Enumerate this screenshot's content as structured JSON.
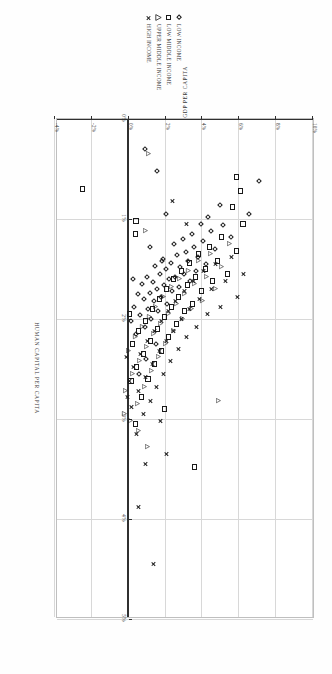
{
  "figure": {
    "orientation_deg": 90,
    "legend": {
      "position": "top-left",
      "items": [
        {
          "label": "LOW INCOME",
          "marker": "diamond-icon",
          "marker_shape": "diamond",
          "color": "#1a1a1a"
        },
        {
          "label": "LOW MIDDLE INCOME",
          "marker": "square-icon",
          "marker_shape": "square",
          "color": "#1a1a1a"
        },
        {
          "label": "UPPER MIDDLE INCOME",
          "marker": "triangle-icon",
          "marker_shape": "triangle",
          "color": "#1a1a1a"
        },
        {
          "label": "HIGH INCOME",
          "marker": "x-icon",
          "marker_shape": "x",
          "color": "#1a1a1a"
        }
      ]
    }
  },
  "chart_data": {
    "type": "scatter",
    "title": "",
    "subtitle": "",
    "xlabel": "HUMAN CAPITAL PER CAPITA",
    "ylabel": "GDP PER CAPITA",
    "xlim": [
      0,
      5
    ],
    "ylim": [
      -4,
      10
    ],
    "xticks": [
      0,
      1,
      2,
      3,
      4,
      5
    ],
    "xticklabels": [
      "0%",
      "1%",
      "2%",
      "3%",
      "4%",
      "5%"
    ],
    "yticks": [
      -4,
      -2,
      0,
      2,
      4,
      6,
      8,
      10
    ],
    "yticklabels": [
      "-4%",
      "-2%",
      "0%",
      "2%",
      "4%",
      "6%",
      "8%",
      "10%"
    ],
    "grid": true,
    "grid_color": "#d8d8d8",
    "axis_color": "#303030",
    "legend_position": "outside-top-left",
    "units": "annual growth rate, percent",
    "series": [
      {
        "name": "LOW INCOME",
        "marker": "diamond",
        "color": "#1a1a1a",
        "points": [
          [
            0.62,
            7.05
          ],
          [
            0.95,
            6.55
          ],
          [
            1.18,
            5.55
          ],
          [
            1.06,
            5.1
          ],
          [
            0.86,
            4.95
          ],
          [
            1.3,
            4.7
          ],
          [
            1.12,
            4.45
          ],
          [
            0.98,
            4.3
          ],
          [
            1.45,
            4.22
          ],
          [
            1.22,
            4.05
          ],
          [
            1.05,
            3.9
          ],
          [
            1.38,
            3.78
          ],
          [
            1.52,
            3.65
          ],
          [
            1.28,
            3.55
          ],
          [
            1.15,
            3.42
          ],
          [
            1.62,
            3.35
          ],
          [
            1.42,
            3.22
          ],
          [
            1.33,
            3.1
          ],
          [
            1.55,
            3.0
          ],
          [
            1.2,
            2.92
          ],
          [
            1.48,
            2.8
          ],
          [
            1.68,
            2.72
          ],
          [
            1.36,
            2.62
          ],
          [
            1.58,
            2.52
          ],
          [
            1.25,
            2.45
          ],
          [
            1.72,
            2.35
          ],
          [
            1.44,
            2.28
          ],
          [
            1.6,
            2.18
          ],
          [
            1.85,
            2.1
          ],
          [
            1.5,
            2.0
          ],
          [
            1.66,
            1.92
          ],
          [
            1.4,
            1.85
          ],
          [
            1.78,
            1.75
          ],
          [
            1.55,
            1.68
          ],
          [
            1.92,
            1.6
          ],
          [
            1.7,
            1.52
          ],
          [
            1.47,
            1.45
          ],
          [
            1.82,
            1.38
          ],
          [
            1.63,
            1.3
          ],
          [
            2.0,
            1.22
          ],
          [
            1.74,
            1.15
          ],
          [
            1.9,
            1.05
          ],
          [
            1.58,
            0.98
          ],
          [
            2.08,
            0.9
          ],
          [
            1.8,
            0.82
          ],
          [
            1.65,
            0.72
          ],
          [
            1.96,
            0.62
          ],
          [
            1.75,
            0.5
          ],
          [
            2.15,
            0.42
          ],
          [
            1.88,
            0.3
          ],
          [
            1.6,
            0.22
          ],
          [
            2.02,
            0.1
          ],
          [
            1.42,
            1.78
          ],
          [
            1.28,
            1.18
          ],
          [
            0.95,
            2.05
          ],
          [
            2.25,
            1.48
          ],
          [
            2.4,
            0.95
          ],
          [
            0.52,
            1.52
          ],
          [
            0.3,
            0.88
          ],
          [
            2.55,
            0.55
          ]
        ]
      },
      {
        "name": "LOW MIDDLE INCOME",
        "marker": "square",
        "color": "#1a1a1a",
        "points": [
          [
            1.05,
            6.2
          ],
          [
            1.32,
            5.85
          ],
          [
            0.88,
            5.62
          ],
          [
            1.55,
            5.35
          ],
          [
            1.18,
            5.05
          ],
          [
            1.42,
            4.8
          ],
          [
            1.62,
            4.55
          ],
          [
            1.28,
            4.38
          ],
          [
            1.5,
            4.15
          ],
          [
            1.72,
            3.95
          ],
          [
            1.35,
            3.8
          ],
          [
            1.58,
            3.62
          ],
          [
            1.85,
            3.48
          ],
          [
            1.44,
            3.32
          ],
          [
            1.66,
            3.18
          ],
          [
            1.92,
            3.02
          ],
          [
            1.52,
            2.88
          ],
          [
            1.78,
            2.72
          ],
          [
            2.05,
            2.58
          ],
          [
            1.6,
            2.45
          ],
          [
            1.88,
            2.3
          ],
          [
            2.18,
            2.18
          ],
          [
            1.7,
            2.05
          ],
          [
            1.98,
            1.92
          ],
          [
            2.32,
            1.8
          ],
          [
            1.8,
            1.68
          ],
          [
            2.1,
            1.55
          ],
          [
            2.45,
            1.42
          ],
          [
            1.9,
            1.3
          ],
          [
            2.22,
            1.18
          ],
          [
            2.6,
            1.05
          ],
          [
            2.02,
            0.92
          ],
          [
            2.35,
            0.8
          ],
          [
            2.78,
            0.68
          ],
          [
            2.12,
            0.55
          ],
          [
            2.48,
            0.42
          ],
          [
            3.05,
            0.35
          ],
          [
            2.25,
            0.22
          ],
          [
            2.62,
            0.12
          ],
          [
            3.48,
            3.55
          ],
          [
            0.72,
            6.05
          ],
          [
            0.58,
            5.85
          ],
          [
            1.95,
            0.05
          ],
          [
            2.9,
            1.95
          ],
          [
            0.7,
            -2.52
          ],
          [
            1.15,
            0.35
          ],
          [
            1.02,
            0.4
          ]
        ]
      },
      {
        "name": "UPPER MIDDLE INCOME",
        "marker": "triangle",
        "color": "#1a1a1a",
        "points": [
          [
            2.82,
            5.35
          ],
          [
            1.25,
            5.95
          ],
          [
            1.48,
            5.52
          ],
          [
            1.7,
            5.18
          ],
          [
            1.35,
            4.92
          ],
          [
            1.58,
            4.68
          ],
          [
            1.82,
            4.45
          ],
          [
            1.42,
            4.25
          ],
          [
            1.65,
            4.05
          ],
          [
            1.9,
            3.88
          ],
          [
            1.52,
            3.7
          ],
          [
            1.75,
            3.52
          ],
          [
            2.0,
            3.38
          ],
          [
            1.6,
            3.22
          ],
          [
            1.85,
            3.05
          ],
          [
            2.12,
            2.92
          ],
          [
            1.68,
            2.78
          ],
          [
            1.95,
            2.62
          ],
          [
            2.25,
            2.48
          ],
          [
            1.78,
            2.35
          ],
          [
            2.05,
            2.2
          ],
          [
            2.38,
            2.08
          ],
          [
            1.88,
            1.95
          ],
          [
            2.15,
            1.82
          ],
          [
            2.52,
            1.7
          ],
          [
            1.98,
            1.58
          ],
          [
            2.28,
            1.45
          ],
          [
            2.68,
            1.32
          ],
          [
            2.08,
            1.2
          ],
          [
            2.42,
            1.08
          ],
          [
            2.85,
            0.95
          ],
          [
            2.18,
            0.82
          ],
          [
            2.55,
            0.7
          ],
          [
            3.02,
            0.58
          ],
          [
            2.32,
            0.45
          ],
          [
            2.72,
            0.32
          ],
          [
            0.35,
            1.55
          ],
          [
            3.28,
            1.48
          ],
          [
            3.12,
            1.02
          ],
          [
            2.95,
            0.22
          ],
          [
            1.12,
            1.38
          ]
        ]
      },
      {
        "name": "HIGH INCOME",
        "marker": "x",
        "color": "#1a1a1a",
        "points": [
          [
            4.45,
            1.32
          ],
          [
            3.88,
            0.52
          ],
          [
            1.55,
            6.25
          ],
          [
            1.78,
            5.88
          ],
          [
            1.38,
            5.55
          ],
          [
            1.62,
            5.25
          ],
          [
            1.88,
            4.98
          ],
          [
            1.45,
            4.72
          ],
          [
            1.7,
            4.48
          ],
          [
            1.95,
            4.25
          ],
          [
            1.52,
            4.05
          ],
          [
            1.8,
            3.85
          ],
          [
            2.08,
            3.68
          ],
          [
            1.62,
            3.5
          ],
          [
            1.9,
            3.32
          ],
          [
            2.18,
            3.15
          ],
          [
            1.72,
            3.0
          ],
          [
            2.0,
            2.85
          ],
          [
            2.3,
            2.7
          ],
          [
            1.82,
            2.55
          ],
          [
            2.12,
            2.42
          ],
          [
            2.42,
            2.28
          ],
          [
            1.92,
            2.15
          ],
          [
            2.22,
            2.02
          ],
          [
            2.55,
            1.9
          ],
          [
            2.02,
            1.78
          ],
          [
            2.32,
            1.65
          ],
          [
            2.68,
            1.52
          ],
          [
            2.12,
            1.4
          ],
          [
            2.45,
            1.28
          ],
          [
            2.82,
            1.15
          ],
          [
            2.22,
            1.02
          ],
          [
            2.58,
            0.9
          ],
          [
            2.95,
            0.78
          ],
          [
            2.35,
            0.65
          ],
          [
            2.72,
            0.52
          ],
          [
            3.15,
            0.4
          ],
          [
            2.48,
            0.28
          ],
          [
            2.88,
            0.15
          ],
          [
            3.35,
            2.05
          ],
          [
            3.02,
            1.72
          ],
          [
            2.62,
            0.05
          ],
          [
            1.05,
            3.15
          ],
          [
            0.82,
            2.35
          ],
          [
            2.78,
            -0.08
          ],
          [
            3.45,
            0.88
          ],
          [
            2.38,
            -0.15
          ]
        ]
      }
    ]
  }
}
